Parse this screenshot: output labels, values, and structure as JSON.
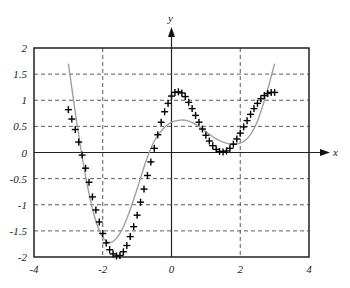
{
  "chart_data": {
    "type": "line",
    "title": "",
    "xlabel": "x",
    "ylabel": "y",
    "xlim": [
      -4,
      4
    ],
    "ylim": [
      -2,
      2
    ],
    "xticks": [
      -4,
      -2,
      0,
      2,
      4
    ],
    "xtick_labels": [
      "-4",
      "-2",
      "0",
      "2",
      "4"
    ],
    "yticks": [
      2,
      1.5,
      1,
      0.5,
      0,
      -0.5,
      -1,
      -1.5,
      -2
    ],
    "ytick_labels": [
      "2",
      "1.5",
      "1",
      "0.5",
      "0",
      "-0.5",
      "-1",
      "-1.5",
      "-2"
    ],
    "grid": true,
    "grid_style": "dashed",
    "legend": null,
    "series": [
      {
        "name": "samples",
        "style": "markers",
        "marker": "+",
        "color": "#000000",
        "x": [
          -3.0,
          -2.9,
          -2.8,
          -2.7,
          -2.6,
          -2.5,
          -2.4,
          -2.3,
          -2.2,
          -2.1,
          -2.0,
          -1.9,
          -1.8,
          -1.7,
          -1.6,
          -1.5,
          -1.4,
          -1.3,
          -1.2,
          -1.1,
          -1.0,
          -0.9,
          -0.8,
          -0.7,
          -0.6,
          -0.5,
          -0.4,
          -0.3,
          -0.2,
          -0.1,
          0.0,
          0.1,
          0.2,
          0.3,
          0.4,
          0.5,
          0.6,
          0.7,
          0.8,
          0.9,
          1.0,
          1.1,
          1.2,
          1.3,
          1.4,
          1.5,
          1.6,
          1.7,
          1.8,
          1.9,
          2.0,
          2.1,
          2.2,
          2.3,
          2.4,
          2.5,
          2.6,
          2.7,
          2.8,
          2.9,
          3.0
        ],
        "y": [
          0.82,
          0.64,
          0.44,
          0.2,
          -0.05,
          -0.3,
          -0.57,
          -0.85,
          -1.1,
          -1.33,
          -1.55,
          -1.73,
          -1.86,
          -1.94,
          -1.98,
          -1.97,
          -1.9,
          -1.78,
          -1.61,
          -1.42,
          -1.2,
          -0.95,
          -0.7,
          -0.44,
          -0.18,
          0.08,
          0.34,
          0.58,
          0.78,
          0.94,
          1.08,
          1.15,
          1.16,
          1.14,
          1.07,
          0.96,
          0.84,
          0.71,
          0.58,
          0.45,
          0.33,
          0.22,
          0.13,
          0.06,
          0.02,
          0.01,
          0.03,
          0.08,
          0.16,
          0.26,
          0.37,
          0.49,
          0.61,
          0.73,
          0.84,
          0.94,
          1.03,
          1.09,
          1.13,
          1.15,
          1.15
        ]
      },
      {
        "name": "fitted curve",
        "style": "line",
        "color": "#a0a0a0",
        "x": [
          -3.0,
          -2.75,
          -2.5,
          -2.25,
          -2.0,
          -1.75,
          -1.5,
          -1.25,
          -1.0,
          -0.75,
          -0.5,
          -0.25,
          0.0,
          0.25,
          0.5,
          0.75,
          1.0,
          1.25,
          1.5,
          1.75,
          2.0,
          2.25,
          2.5,
          2.75,
          3.0
        ],
        "y": [
          1.7,
          0.55,
          -0.45,
          -1.2,
          -1.62,
          -1.72,
          -1.55,
          -1.18,
          -0.7,
          -0.18,
          0.22,
          0.45,
          0.58,
          0.62,
          0.6,
          0.52,
          0.4,
          0.28,
          0.2,
          0.16,
          0.18,
          0.3,
          0.6,
          1.1,
          1.7
        ]
      }
    ]
  },
  "labels": {
    "x_axis": "x",
    "y_axis": "y"
  }
}
